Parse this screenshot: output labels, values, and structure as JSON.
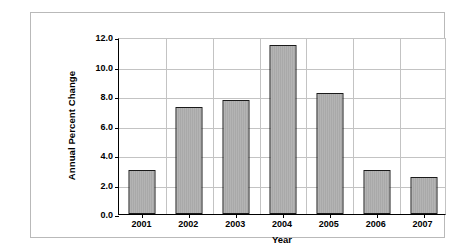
{
  "chart_data": {
    "type": "bar",
    "title": "",
    "xlabel": "Year",
    "ylabel": "Annual Percent Change",
    "categories": [
      "2001",
      "2002",
      "2003",
      "2004",
      "2005",
      "2006",
      "2007"
    ],
    "values": [
      3.0,
      7.25,
      7.7,
      11.45,
      8.2,
      3.0,
      2.5
    ],
    "ylim": [
      0.0,
      12.0
    ],
    "yticks": [
      "0.0",
      "2.0",
      "4.0",
      "6.0",
      "8.0",
      "10.0",
      "12.0"
    ],
    "ytick_values": [
      0.0,
      2.0,
      4.0,
      6.0,
      8.0,
      10.0,
      12.0
    ],
    "grid": "horizontal-and-vertical",
    "legend": "none",
    "series": [
      {
        "name": "Annual Percent Change",
        "values": [
          3.0,
          7.25,
          7.7,
          11.45,
          8.2,
          3.0,
          2.5
        ]
      }
    ],
    "colors": {
      "bar_fill": "#a9a9a9",
      "bar_border": "#1a1a1a",
      "gridline": "#c3c3c3",
      "axis": "#000000",
      "frame": "#b9b9b9",
      "background": "#ffffff",
      "text": "#000000"
    }
  }
}
